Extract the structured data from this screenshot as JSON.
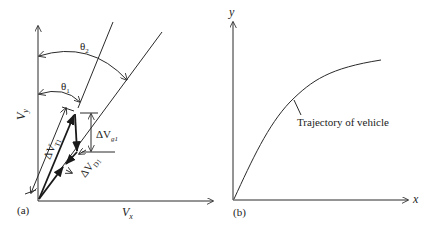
{
  "panel_a": {
    "label": "(a)",
    "x_axis_label": "V",
    "x_axis_sub": "x",
    "y_axis_label": "V",
    "y_axis_sub": "y",
    "theta1": {
      "sym": "θ",
      "sub": "1"
    },
    "theta2": {
      "sym": "θ",
      "sub": "2"
    },
    "dVT1": {
      "sym": "ΔV",
      "sub": "T1"
    },
    "dVg1": {
      "sym": "ΔV",
      "sub": "g1"
    },
    "dVD1": {
      "sym": "ΔV",
      "sub": "D1"
    }
  },
  "panel_b": {
    "label": "(b)",
    "x_axis_label": "x",
    "y_axis_label": "y",
    "curve_label": "Trajectory of vehicle"
  }
}
